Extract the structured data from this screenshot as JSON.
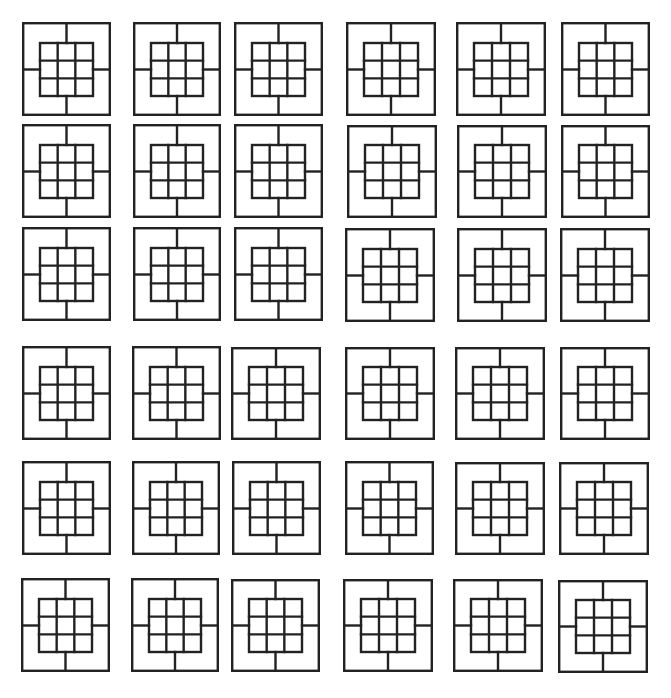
{
  "figure": {
    "width": 671,
    "height": 698,
    "background": "#ffffff",
    "stroke_color": "#222222",
    "stroke_width": 2.4,
    "tile_description": "Square outer frame containing a centered 3x3 grid; four connector lines join the grid's edge midpoints to the frame (top, bottom, left, right).",
    "inner_grid": {
      "rows": 3,
      "cols": 3,
      "inset_x_ratio": 0.2,
      "inset_top_ratio": 0.22,
      "inset_bottom_ratio": 0.21
    },
    "rows": 6,
    "cols": 6
  },
  "tiles": [
    {
      "row": 1,
      "col": 1,
      "x": 22,
      "y": 22,
      "w": 89,
      "h": 94
    },
    {
      "row": 1,
      "col": 2,
      "x": 133,
      "y": 22,
      "w": 88,
      "h": 94
    },
    {
      "row": 1,
      "col": 3,
      "x": 234,
      "y": 22,
      "w": 89,
      "h": 94
    },
    {
      "row": 1,
      "col": 4,
      "x": 346,
      "y": 22,
      "w": 90,
      "h": 94
    },
    {
      "row": 1,
      "col": 5,
      "x": 456,
      "y": 22,
      "w": 90,
      "h": 94
    },
    {
      "row": 1,
      "col": 6,
      "x": 561,
      "y": 22,
      "w": 89,
      "h": 94
    },
    {
      "row": 2,
      "col": 1,
      "x": 22,
      "y": 124,
      "w": 89,
      "h": 94
    },
    {
      "row": 2,
      "col": 2,
      "x": 133,
      "y": 124,
      "w": 88,
      "h": 94
    },
    {
      "row": 2,
      "col": 3,
      "x": 234,
      "y": 124,
      "w": 89,
      "h": 94
    },
    {
      "row": 2,
      "col": 4,
      "x": 347,
      "y": 125,
      "w": 90,
      "h": 93
    },
    {
      "row": 2,
      "col": 5,
      "x": 457,
      "y": 125,
      "w": 90,
      "h": 93
    },
    {
      "row": 2,
      "col": 6,
      "x": 561,
      "y": 125,
      "w": 89,
      "h": 93
    },
    {
      "row": 3,
      "col": 1,
      "x": 22,
      "y": 227,
      "w": 89,
      "h": 94
    },
    {
      "row": 3,
      "col": 2,
      "x": 133,
      "y": 227,
      "w": 88,
      "h": 94
    },
    {
      "row": 3,
      "col": 3,
      "x": 234,
      "y": 227,
      "w": 89,
      "h": 94
    },
    {
      "row": 3,
      "col": 4,
      "x": 345,
      "y": 228,
      "w": 90,
      "h": 94
    },
    {
      "row": 3,
      "col": 5,
      "x": 457,
      "y": 228,
      "w": 90,
      "h": 94
    },
    {
      "row": 3,
      "col": 6,
      "x": 560,
      "y": 228,
      "w": 90,
      "h": 94
    },
    {
      "row": 4,
      "col": 1,
      "x": 22,
      "y": 346,
      "w": 89,
      "h": 94
    },
    {
      "row": 4,
      "col": 2,
      "x": 132,
      "y": 346,
      "w": 89,
      "h": 94
    },
    {
      "row": 4,
      "col": 3,
      "x": 231,
      "y": 347,
      "w": 90,
      "h": 93
    },
    {
      "row": 4,
      "col": 4,
      "x": 345,
      "y": 347,
      "w": 90,
      "h": 93
    },
    {
      "row": 4,
      "col": 5,
      "x": 455,
      "y": 347,
      "w": 90,
      "h": 93
    },
    {
      "row": 4,
      "col": 6,
      "x": 560,
      "y": 347,
      "w": 90,
      "h": 93
    },
    {
      "row": 5,
      "col": 1,
      "x": 22,
      "y": 461,
      "w": 89,
      "h": 94
    },
    {
      "row": 5,
      "col": 2,
      "x": 132,
      "y": 461,
      "w": 88,
      "h": 94
    },
    {
      "row": 5,
      "col": 3,
      "x": 232,
      "y": 461,
      "w": 89,
      "h": 94
    },
    {
      "row": 5,
      "col": 4,
      "x": 345,
      "y": 461,
      "w": 89,
      "h": 94
    },
    {
      "row": 5,
      "col": 5,
      "x": 455,
      "y": 462,
      "w": 90,
      "h": 93
    },
    {
      "row": 5,
      "col": 6,
      "x": 559,
      "y": 462,
      "w": 90,
      "h": 93
    },
    {
      "row": 6,
      "col": 1,
      "x": 21,
      "y": 578,
      "w": 89,
      "h": 94
    },
    {
      "row": 6,
      "col": 2,
      "x": 131,
      "y": 578,
      "w": 88,
      "h": 94
    },
    {
      "row": 6,
      "col": 3,
      "x": 231,
      "y": 579,
      "w": 89,
      "h": 93
    },
    {
      "row": 6,
      "col": 4,
      "x": 343,
      "y": 579,
      "w": 90,
      "h": 93
    },
    {
      "row": 6,
      "col": 5,
      "x": 453,
      "y": 579,
      "w": 90,
      "h": 93
    },
    {
      "row": 6,
      "col": 6,
      "x": 558,
      "y": 580,
      "w": 90,
      "h": 93
    }
  ]
}
